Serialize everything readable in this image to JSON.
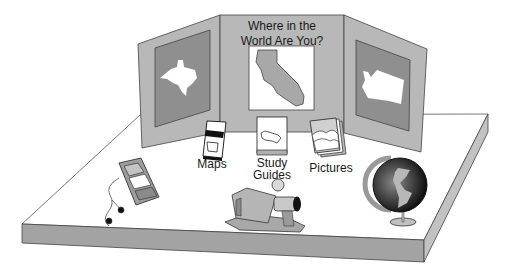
{
  "board": {
    "title_line1": "Where in the",
    "title_line2": "World Are You?",
    "left_panel_state": "Texas",
    "center_panel_state": "California",
    "right_panel_state": "Washington"
  },
  "items": {
    "maps_label": "Maps",
    "study_label_line1": "Study",
    "study_label_line2": "Guides",
    "pictures_label": "Pictures"
  },
  "colors": {
    "panel": "#b8b8b8",
    "panel_inner": "#8f8f8f",
    "table_edge": "#9e9e9e",
    "outline": "#3a3a3a"
  }
}
